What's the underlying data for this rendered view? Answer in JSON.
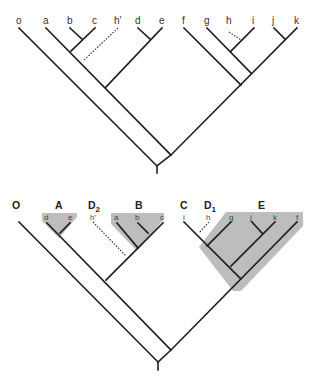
{
  "figure": {
    "top_tree": {
      "tips": [
        "o",
        "a",
        "b",
        "c",
        "h'",
        "d",
        "e",
        "f",
        "g",
        "h",
        "i",
        "j",
        "k"
      ]
    },
    "bottom_tree": {
      "groups": [
        "O",
        "A",
        "D",
        "B",
        "C",
        "D",
        "E"
      ],
      "group_subscripts": {
        "D2": "2",
        "D1": "1"
      },
      "group_labels": {
        "O": "O",
        "A": "A",
        "D2": "D",
        "B": "B",
        "C": "C",
        "D1": "D",
        "E": "E"
      },
      "tips": {
        "A": [
          "d",
          "e"
        ],
        "D2": [
          "h'"
        ],
        "B": [
          "a",
          "b",
          "c"
        ],
        "C": [
          "i"
        ],
        "D1": [
          "h"
        ],
        "E": [
          "g",
          "j",
          "k",
          "f"
        ]
      }
    },
    "colors": {
      "branch": "#1f1f1f",
      "shade": "#bdbdbd",
      "background": "#ffffff"
    }
  }
}
